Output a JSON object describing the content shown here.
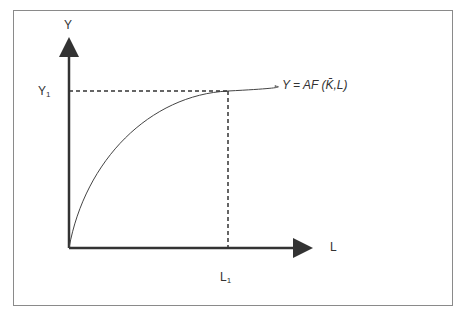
{
  "diagram": {
    "y_axis_label": "Y",
    "x_axis_label": "L",
    "y1_label": "Y",
    "y1_sub": "1",
    "l1_label": "L",
    "l1_sub": "1",
    "curve_equation": "Y = AF (K̄,L)",
    "colors": {
      "axis": "#333333",
      "frame": "#8a8a8a",
      "curve": "#444444"
    }
  }
}
